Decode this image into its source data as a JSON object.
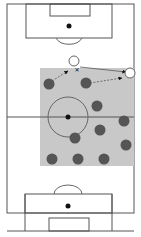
{
  "diagram": {
    "type": "football-pitch-tactical",
    "colors": {
      "background": "#ffffff",
      "line": "#555555",
      "zone": "#c8c8c8",
      "team_dark": "#555555",
      "team_light": "#ffffff",
      "spot": "#111111"
    },
    "pitch": {
      "x": 7,
      "y": 4,
      "w": 127,
      "h": 209
    },
    "halfway_y": 117,
    "center": {
      "x": 68,
      "y": 117,
      "r": 20
    },
    "zone": {
      "x": 40,
      "y": 68,
      "w": 94,
      "h": 98
    },
    "dark_players": [
      {
        "x": 49,
        "y": 84
      },
      {
        "x": 86,
        "y": 83
      },
      {
        "x": 97,
        "y": 106
      },
      {
        "x": 124,
        "y": 121
      },
      {
        "x": 100,
        "y": 130
      },
      {
        "x": 75,
        "y": 138
      },
      {
        "x": 126,
        "y": 145
      },
      {
        "x": 52,
        "y": 159
      },
      {
        "x": 78,
        "y": 159
      },
      {
        "x": 104,
        "y": 159
      }
    ],
    "light_players": [
      {
        "x": 74,
        "y": 61
      },
      {
        "x": 130,
        "y": 73
      }
    ],
    "ball_marker": {
      "x": 77,
      "y": 69,
      "symbol": "✕"
    }
  }
}
